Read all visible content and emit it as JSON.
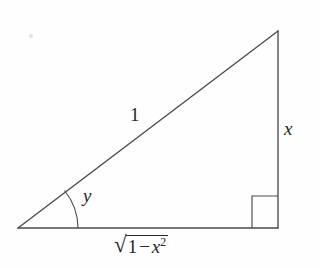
{
  "figure": {
    "type": "geometric-diagram",
    "background_color": "#fefefe",
    "stroke_color": "#4a4a4a",
    "text_color": "#262626"
  },
  "labels": {
    "hypotenuse": "1",
    "opposite_side": "x",
    "angle": "y",
    "adjacent_side": {
      "radical": "√",
      "numeral": "1",
      "operator": "−",
      "variable": "x",
      "exponent": "2",
      "full_text": "√(1 − x²)"
    }
  },
  "geometry": {
    "vertices": {
      "left": [
        18,
        228
      ],
      "bottom_right": [
        278,
        228
      ],
      "apex": [
        278,
        31
      ]
    },
    "right_angle_marker": {
      "x": 252,
      "y": 196,
      "size": 26,
      "at_vertex": "bottom_right"
    },
    "angle_arc": {
      "at_vertex": "left",
      "radius": 60,
      "label": "y"
    }
  }
}
